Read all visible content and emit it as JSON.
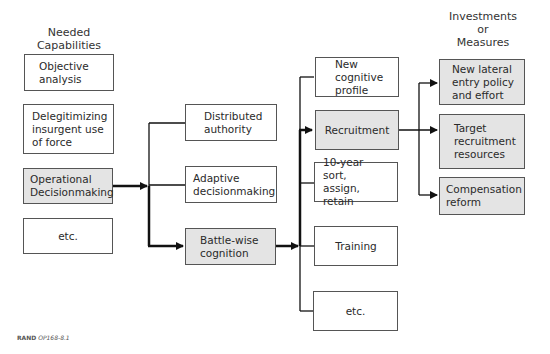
{
  "headers": {
    "left": "Needed\nCapabilities",
    "right": "Investments\nor\nMeasures"
  },
  "column1": [
    {
      "label": "Objective\nanalysis",
      "shaded": false
    },
    {
      "label": "Delegitimizing\ninsurgent use\nof force",
      "shaded": false
    },
    {
      "label": "Operational\nDecisionmaking",
      "shaded": true
    },
    {
      "label": "etc.",
      "shaded": false
    }
  ],
  "column2": [
    {
      "label": "Distributed\nauthority",
      "shaded": false
    },
    {
      "label": "Adaptive\ndecisionmaking",
      "shaded": false
    },
    {
      "label": "Battle-wise\ncognition",
      "shaded": true
    }
  ],
  "column3": [
    {
      "label": "New\ncognitive\nprofile",
      "shaded": false
    },
    {
      "label": "Recruitment",
      "shaded": true
    },
    {
      "label": "10-year sort,\nassign, retain",
      "shaded": false
    },
    {
      "label": "Training",
      "shaded": false
    },
    {
      "label": "etc.",
      "shaded": false
    }
  ],
  "column4": [
    {
      "label": "New lateral\nentry policy\nand effort",
      "shaded": true
    },
    {
      "label": "Target\nrecruitment\nresources",
      "shaded": true
    },
    {
      "label": "Compensation\nreform",
      "shaded": true
    }
  ],
  "footer": {
    "org": "RAND",
    "code": "OP168-8.1"
  },
  "colors": {
    "shaded_fill": "#e4e4e4",
    "line": "#111111",
    "border": "#555555"
  }
}
